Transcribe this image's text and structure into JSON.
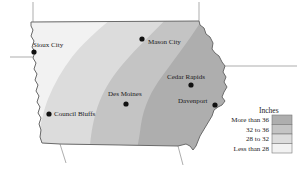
{
  "map": {
    "title": "Iowa annual precipitation",
    "region": "Iowa",
    "cities": [
      {
        "name": "Sioux City",
        "label_x": 33,
        "label_y": 47,
        "dot_x": 34,
        "dot_y": 52,
        "anchor": "start"
      },
      {
        "name": "Mason City",
        "label_x": 148,
        "label_y": 44,
        "dot_x": 142,
        "dot_y": 39,
        "anchor": "start"
      },
      {
        "name": "Cedar Rapids",
        "label_x": 167,
        "label_y": 79,
        "dot_x": 191,
        "dot_y": 85,
        "anchor": "start"
      },
      {
        "name": "Des Moines",
        "label_x": 108,
        "label_y": 96,
        "dot_x": 126,
        "dot_y": 104,
        "anchor": "start"
      },
      {
        "name": "Davenport",
        "label_x": 178,
        "label_y": 103,
        "dot_x": 215,
        "dot_y": 105,
        "anchor": "start"
      },
      {
        "name": "Council Bluffs",
        "label_x": 54,
        "label_y": 116,
        "dot_x": 49,
        "dot_y": 114,
        "anchor": "start"
      }
    ]
  },
  "legend": {
    "title": "Inches",
    "title_x": 259,
    "title_y": 113,
    "swatch_x": 272,
    "swatch_y": 115,
    "swatch_w": 20,
    "swatch_h": 9.5,
    "label_x": 269,
    "entries": [
      {
        "label": "More than 36",
        "color": "#aeaeae"
      },
      {
        "label": "32 to 36",
        "color": "#c4c4c4"
      },
      {
        "label": "28 to 32",
        "color": "#dcdcdc"
      },
      {
        "label": "Less than 28",
        "color": "#f2f2f2"
      }
    ]
  },
  "colors": {
    "band_more_than_36": "#aeaeae",
    "band_32_to_36": "#c4c4c4",
    "band_28_to_32": "#dcdcdc",
    "band_less_than_28": "#f2f2f2",
    "outline": "#6b6b6b",
    "neighbor_line": "#8a8a8a",
    "text": "#1a1a1a",
    "dot": "#111111",
    "background": "#ffffff"
  },
  "chart_data": {
    "type": "map",
    "title": "Inches",
    "legend_position": "bottom-right",
    "categories": [
      "More than 36",
      "32 to 36",
      "28 to 32",
      "Less than 28"
    ],
    "values": [
      36,
      34,
      30,
      28
    ],
    "units": "inches",
    "points": [
      {
        "name": "Sioux City",
        "band": "Less than 28"
      },
      {
        "name": "Mason City",
        "band": "More than 36"
      },
      {
        "name": "Cedar Rapids",
        "band": "More than 36"
      },
      {
        "name": "Des Moines",
        "band": "32 to 36"
      },
      {
        "name": "Davenport",
        "band": "More than 36"
      },
      {
        "name": "Council Bluffs",
        "band": "32 to 36"
      }
    ]
  }
}
